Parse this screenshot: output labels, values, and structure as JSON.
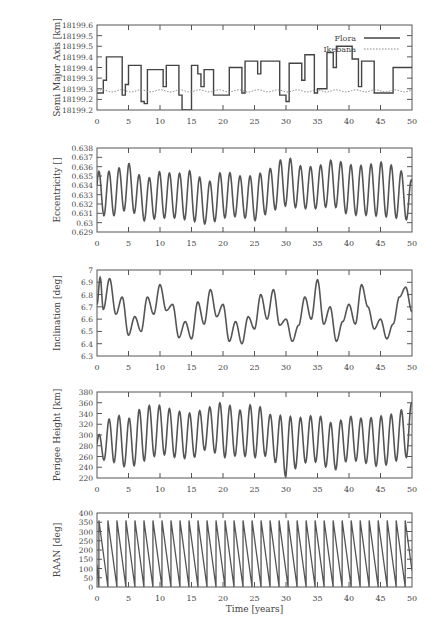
{
  "figure": {
    "xlabel": "Time [years]",
    "x_ticks": [
      "0",
      "5",
      "10",
      "15",
      "20",
      "25",
      "30",
      "35",
      "40",
      "45",
      "50"
    ],
    "legend": [
      {
        "label": "Flora",
        "style": "solid"
      },
      {
        "label": "Ikebana",
        "style": "dotted"
      }
    ]
  },
  "chart_data": [
    {
      "type": "line",
      "title": "",
      "xlabel": "Time [years]",
      "ylabel": "Semi Major Axis [km]",
      "xlim": [
        0,
        50
      ],
      "ylim": [
        18199.2,
        18199.6
      ],
      "y_tick_labels": [
        "18199.6",
        "18199.5",
        "18199.5",
        "18199.4",
        "18199.4",
        "18199.3",
        "18199.3",
        "18199.2",
        "18199.2"
      ],
      "legend_position": "upper right",
      "series": [
        {
          "name": "Flora",
          "style": "solid",
          "x": [
            0,
            0.5,
            1,
            1.5,
            3.5,
            4,
            4.5,
            5,
            6.5,
            7,
            7.5,
            8,
            8.5,
            10,
            10.5,
            11,
            12,
            12.5,
            13,
            13.5,
            14,
            15,
            15.5,
            16,
            16.5,
            17,
            18,
            18.5,
            20.5,
            21,
            22.5,
            23,
            23.5,
            25,
            25.5,
            26,
            27,
            28,
            29,
            30,
            30.5,
            31,
            32.5,
            33,
            34,
            34.5,
            35,
            36.5,
            37,
            37.5,
            38,
            40,
            40.5,
            41,
            41.5,
            42,
            43,
            44,
            44.5,
            46.5,
            47,
            49,
            49.5,
            50
          ],
          "y": [
            18199.28,
            18199.28,
            18199.34,
            18199.45,
            18199.45,
            18199.27,
            18199.32,
            18199.41,
            18199.41,
            18199.24,
            18199.23,
            18199.39,
            18199.39,
            18199.39,
            18199.31,
            18199.41,
            18199.41,
            18199.41,
            18199.27,
            18199.2,
            18199.2,
            18199.41,
            18199.41,
            18199.37,
            18199.31,
            18199.39,
            18199.39,
            18199.27,
            18199.27,
            18199.4,
            18199.4,
            18199.28,
            18199.43,
            18199.43,
            18199.37,
            18199.43,
            18199.43,
            18199.43,
            18199.27,
            18199.24,
            18199.42,
            18199.42,
            18199.34,
            18199.46,
            18199.46,
            18199.28,
            18199.3,
            18199.47,
            18199.47,
            18199.4,
            18199.5,
            18199.5,
            18199.44,
            18199.44,
            18199.31,
            18199.43,
            18199.43,
            18199.28,
            18199.28,
            18199.28,
            18199.4,
            18199.4,
            18199.4,
            18199.4
          ]
        },
        {
          "name": "Ikebana",
          "style": "dotted",
          "x": [
            0,
            5,
            10,
            15,
            20,
            25,
            30,
            35,
            40,
            45,
            50
          ],
          "y": [
            18199.29,
            18199.29,
            18199.3,
            18199.28,
            18199.29,
            18199.29,
            18199.28,
            18199.29,
            18199.29,
            18199.28,
            18199.29
          ]
        }
      ]
    },
    {
      "type": "line",
      "xlabel": "",
      "ylabel": "Eccentricity []",
      "xlim": [
        0,
        50
      ],
      "ylim": [
        0.629,
        0.638
      ],
      "y_tick_labels": [
        "0.638",
        "0.637",
        "0.636",
        "0.635",
        "0.634",
        "0.633",
        "0.632",
        "0.631",
        "0.63",
        "0.629"
      ],
      "description": "Oscillation with period ~1.6 years between ~0.630 and ~0.637; amplitude grows toward 30-45 years",
      "series": [
        {
          "name": "Eccentricity",
          "style": "solid",
          "x": [
            0,
            2.5,
            5,
            7.5,
            10,
            12.5,
            15,
            17.5,
            20,
            22.5,
            25,
            27.5,
            30,
            32.5,
            35,
            37.5,
            40,
            42.5,
            45,
            47.5,
            50
          ],
          "peaks": [
            0.6355,
            0.6355,
            0.6364,
            0.6345,
            0.6355,
            0.6352,
            0.6356,
            0.6342,
            0.6356,
            0.635,
            0.635,
            0.6358,
            0.6372,
            0.636,
            0.636,
            0.6368,
            0.6362,
            0.6361,
            0.6365,
            0.636,
            0.6345
          ],
          "troughs": [
            0.6308,
            0.6307,
            0.6315,
            0.6302,
            0.6305,
            0.6305,
            0.6302,
            0.6298,
            0.6305,
            0.6307,
            0.6302,
            0.6312,
            0.6318,
            0.6315,
            0.6315,
            0.6318,
            0.6308,
            0.6308,
            0.6307,
            0.6305,
            0.6302
          ]
        }
      ]
    },
    {
      "type": "line",
      "xlabel": "",
      "ylabel": "Inclination [deg]",
      "xlim": [
        0,
        50
      ],
      "ylim": [
        6.3,
        7.0
      ],
      "y_tick_labels": [
        "7",
        "6.9",
        "6.8",
        "6.7",
        "6.6",
        "6.5",
        "6.4",
        "6.3"
      ],
      "series": [
        {
          "name": "Inclination",
          "style": "solid",
          "x": [
            0,
            0.5,
            1,
            2,
            3,
            4,
            5,
            6,
            7,
            8,
            9,
            10,
            11,
            12,
            13,
            14,
            15,
            16,
            17,
            18,
            19,
            20,
            21,
            22,
            23,
            24,
            25,
            26,
            27,
            28,
            29,
            30,
            31,
            32,
            33,
            34,
            35,
            36,
            37,
            38,
            39,
            40,
            41,
            42,
            43,
            44,
            45,
            46,
            47,
            48,
            49,
            50
          ],
          "y": [
            6.72,
            6.94,
            6.68,
            6.93,
            6.64,
            6.78,
            6.47,
            6.62,
            6.5,
            6.78,
            6.64,
            6.88,
            6.67,
            6.72,
            6.45,
            6.58,
            6.44,
            6.74,
            6.56,
            6.84,
            6.62,
            6.72,
            6.42,
            6.58,
            6.4,
            6.62,
            6.52,
            6.8,
            6.6,
            6.84,
            6.55,
            6.6,
            6.42,
            6.55,
            6.78,
            6.6,
            6.92,
            6.56,
            6.7,
            6.42,
            6.58,
            6.72,
            6.56,
            6.88,
            6.7,
            6.52,
            6.6,
            6.44,
            6.56,
            6.78,
            6.86,
            6.66
          ]
        }
      ]
    },
    {
      "type": "line",
      "xlabel": "",
      "ylabel": "Perigee Height [km]",
      "xlim": [
        0,
        50
      ],
      "ylim": [
        220,
        380
      ],
      "y_tick_labels": [
        "380",
        "360",
        "340",
        "320",
        "300",
        "280",
        "260",
        "240",
        "220"
      ],
      "description": "Oscillation with period ~1.6 years between ~240 and ~360 km",
      "series": [
        {
          "name": "Perigee Height",
          "style": "solid",
          "x": [
            0,
            2.5,
            5,
            7.5,
            10,
            12.5,
            15,
            17.5,
            20,
            22.5,
            25,
            27.5,
            30,
            32.5,
            35,
            37.5,
            40,
            42.5,
            45,
            47.5,
            50
          ],
          "peaks": [
            295,
            340,
            330,
            355,
            355,
            345,
            340,
            350,
            362,
            345,
            360,
            338,
            335,
            332,
            338,
            320,
            335,
            330,
            335,
            340,
            360
          ],
          "troughs": [
            256,
            250,
            238,
            252,
            265,
            258,
            255,
            275,
            258,
            262,
            258,
            262,
            222,
            248,
            250,
            232,
            255,
            248,
            240,
            252,
            262
          ]
        }
      ]
    },
    {
      "type": "line",
      "xlabel": "Time [years]",
      "ylabel": "RAAN [deg]",
      "xlim": [
        0,
        50
      ],
      "ylim": [
        0,
        400
      ],
      "y_tick_labels": [
        "400",
        "350",
        "300",
        "250",
        "200",
        "150",
        "100",
        "50",
        "0"
      ],
      "description": "Sawtooth: RAAN decreases from 360 to 0 roughly every 1.43 years (~35 cycles over 50 years)",
      "series": [
        {
          "name": "RAAN",
          "style": "solid",
          "period_years": 1.43,
          "max": 360,
          "min": 0
        }
      ]
    }
  ]
}
